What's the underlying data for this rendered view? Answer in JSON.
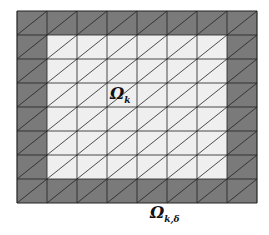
{
  "diagram": {
    "type": "triangulated-mesh",
    "grid": {
      "cols": 8,
      "rows": 8,
      "x0": 17,
      "y0": 11,
      "cell_w": 30,
      "cell_h": 24
    },
    "boundary_layer_width_cells": 1,
    "diagonal_direction": "bottom-left-to-top-right",
    "colors": {
      "boundary_fill": "#7a7a7a",
      "interior_fill": "#efefef",
      "line": "#222222"
    },
    "labels": {
      "interior": {
        "symbol": "Ω",
        "subscript": "k"
      },
      "boundary": {
        "symbol": "Ω",
        "subscript": "k,δ"
      }
    }
  }
}
